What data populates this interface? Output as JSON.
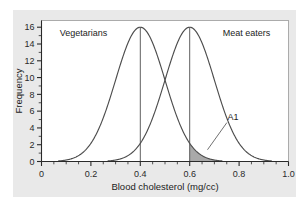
{
  "chart_data": {
    "type": "line",
    "title": "",
    "subtitle": "",
    "xlabel": "Blood cholesterol (mg/cc)",
    "ylabel": "Frequency",
    "xlim": [
      0,
      1.0
    ],
    "ylim": [
      0,
      16.8
    ],
    "grid": false,
    "legend_position": "inline-annotation",
    "xticks": [
      0,
      0.2,
      0.4,
      0.6,
      0.8,
      1.0
    ],
    "xticklabels": [
      "0",
      "0.2",
      "0.4",
      "0.6",
      "0.8",
      "1.0"
    ],
    "xminor_step": 0.05,
    "yticks": [
      0,
      2,
      4,
      6,
      8,
      10,
      12,
      14,
      16
    ],
    "yticklabels": [
      "0",
      "2",
      "4",
      "6",
      "8",
      "10",
      "12",
      "14",
      "16"
    ],
    "yminor_step": 1,
    "series": [
      {
        "name": "Vegetarians",
        "distribution": "normal",
        "mean": 0.4,
        "sigma": 0.1,
        "peak": 16,
        "color": "#4d4d4d",
        "label_x": 0.17,
        "label_y": 15.0
      },
      {
        "name": "Meat eaters",
        "distribution": "normal",
        "mean": 0.6,
        "sigma": 0.1,
        "peak": 16,
        "color": "#4d4d4d",
        "label_x": 0.83,
        "label_y": 15.0
      }
    ],
    "vertical_lines": [
      {
        "x": 0.4,
        "y_top": 16,
        "series": "Vegetarians"
      },
      {
        "x": 0.6,
        "y_top": 16,
        "series": "Meat eaters"
      }
    ],
    "shaded_regions": [
      {
        "label": "A1",
        "series": "Vegetarians",
        "x_start": 0.6,
        "x_end": 0.745,
        "fill": "#a9a9a9",
        "annotation_x": 0.775,
        "annotation_y": 5.0
      }
    ],
    "annotations": [
      {
        "text": "A1",
        "x": 0.775,
        "y": 5.0
      },
      {
        "text": "Vegetarians",
        "x": 0.17,
        "y": 15.0
      },
      {
        "text": "Meat eaters",
        "x": 0.83,
        "y": 15.0
      }
    ],
    "colors": {
      "curve": "#4d4d4d",
      "axis": "#2a2a2a",
      "shade": "#a9a9a9",
      "panel_background": "#e9e9e9",
      "plot_background": "#ffffff"
    }
  },
  "axes": {
    "x_title": "Blood cholesterol (mg/cc)",
    "y_title": "Frequency"
  },
  "labels": {
    "vegetarians": "Vegetarians",
    "meat_eaters": "Meat eaters",
    "area_a1": "A1"
  },
  "xtick_labels": {
    "t0": "0",
    "t1": "0.2",
    "t2": "0.4",
    "t3": "0.6",
    "t4": "0.8",
    "t5": "1.0"
  },
  "ytick_labels": {
    "t0": "0",
    "t1": "2",
    "t2": "4",
    "t3": "6",
    "t4": "8",
    "t5": "10",
    "t6": "12",
    "t7": "14",
    "t8": "16"
  }
}
